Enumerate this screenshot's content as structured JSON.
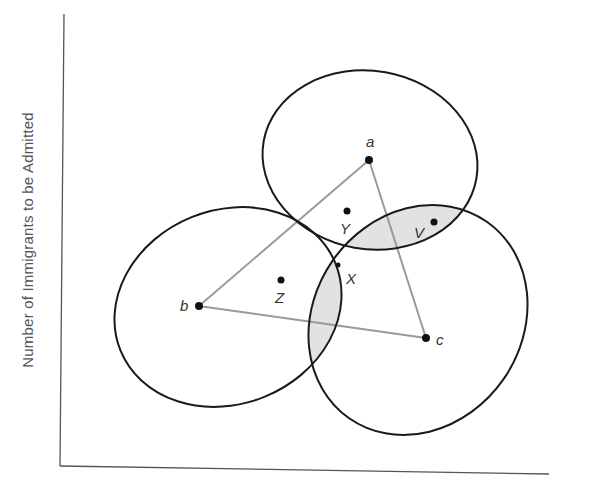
{
  "diagram": {
    "y_axis_label": "Number of Immigrants to be Admitted",
    "x_axis_label": "",
    "points": [
      {
        "id": "a",
        "label": "a",
        "x": 369,
        "y": 160,
        "label_x": 366,
        "label_y": 147
      },
      {
        "id": "b",
        "label": "b",
        "x": 199,
        "y": 306,
        "label_x": 180,
        "label_y": 310
      },
      {
        "id": "c",
        "label": "c",
        "x": 426,
        "y": 338,
        "label_x": 436,
        "label_y": 345
      },
      {
        "id": "Y",
        "label": "Y",
        "x": 347,
        "y": 211,
        "label_x": 340,
        "label_y": 233
      },
      {
        "id": "V",
        "label": "V",
        "x": 434,
        "y": 222,
        "label_x": 414,
        "label_y": 237
      },
      {
        "id": "Z",
        "label": "Z",
        "x": 281,
        "y": 280,
        "label_x": 275,
        "label_y": 302
      },
      {
        "id": "X",
        "label": "X",
        "x": 338,
        "y": 265,
        "label_x": 346,
        "label_y": 283
      }
    ],
    "indifference_curves": [
      {
        "around": "a",
        "cx": 370,
        "cy": 160,
        "rx": 108,
        "ry": 89,
        "rotate": 10
      },
      {
        "around": "b",
        "cx": 228,
        "cy": 307,
        "rx": 116,
        "ry": 97,
        "rotate": -22
      },
      {
        "around": "c",
        "cx": 418,
        "cy": 320,
        "rx": 120,
        "ry": 104,
        "rotate": -55
      }
    ],
    "triangle": [
      "a",
      "b",
      "c"
    ],
    "colors": {
      "curve": "#1a1a1a",
      "triangle": "#9a9a9a",
      "shade": "#e2e2e2",
      "axis": "#555555",
      "point": "#111111"
    }
  }
}
